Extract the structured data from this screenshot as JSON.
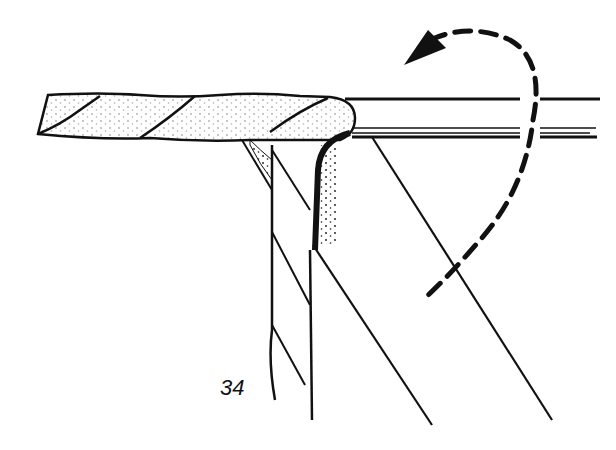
{
  "figure": {
    "label": "34",
    "colors": {
      "ink": "#111111",
      "background": "#ffffff"
    },
    "elements": [
      "horizontal-rope",
      "horizontal-bar",
      "hanging-rope",
      "support-lines",
      "dashed-rotation-arrow"
    ]
  }
}
